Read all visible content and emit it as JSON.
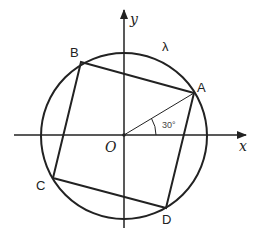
{
  "diagram": {
    "type": "geometry",
    "axes": {
      "x_label": "x",
      "y_label": "y",
      "origin_label": "O"
    },
    "circle": {
      "label": "λ",
      "center": "O"
    },
    "points": [
      {
        "name": "A",
        "label": "A",
        "angle_deg": 30
      },
      {
        "name": "B",
        "label": "B",
        "angle_deg": 120
      },
      {
        "name": "C",
        "label": "C",
        "angle_deg": 210
      },
      {
        "name": "D",
        "label": "D",
        "angle_deg": 300
      }
    ],
    "angle_annotation": "30°",
    "colors": {
      "stroke": "#222222",
      "background": "#ffffff"
    }
  }
}
